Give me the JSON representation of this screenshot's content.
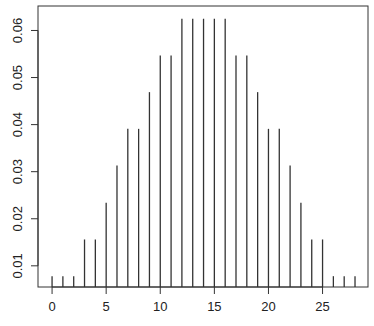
{
  "chart_data": {
    "type": "bar",
    "style": "needle",
    "title": "",
    "xlabel": "",
    "ylabel": "",
    "x": [
      0,
      1,
      2,
      3,
      4,
      5,
      6,
      7,
      8,
      9,
      10,
      11,
      12,
      13,
      14,
      15,
      16,
      17,
      18,
      19,
      20,
      21,
      22,
      23,
      24,
      25,
      26,
      27,
      28
    ],
    "values": [
      0.0078,
      0.0078,
      0.0078,
      0.0156,
      0.0156,
      0.0234,
      0.0313,
      0.0391,
      0.0391,
      0.0469,
      0.0547,
      0.0547,
      0.0625,
      0.0625,
      0.0625,
      0.0625,
      0.0625,
      0.0547,
      0.0547,
      0.0469,
      0.0391,
      0.0391,
      0.0313,
      0.0234,
      0.0156,
      0.0156,
      0.0078,
      0.0078,
      0.0078
    ],
    "xlim": [
      -1.3,
      29.2
    ],
    "ylim": [
      0.0055,
      0.0652
    ],
    "x_ticks": [
      0,
      5,
      10,
      15,
      20,
      25
    ],
    "x_tick_labels": [
      "0",
      "5",
      "10",
      "15",
      "20",
      "25"
    ],
    "y_ticks": [
      0.01,
      0.02,
      0.03,
      0.04,
      0.05,
      0.06
    ],
    "y_tick_labels": [
      "0.01",
      "0.02",
      "0.03",
      "0.04",
      "0.05",
      "0.06"
    ],
    "grid": false,
    "legend": null,
    "line_color": "#333333"
  }
}
